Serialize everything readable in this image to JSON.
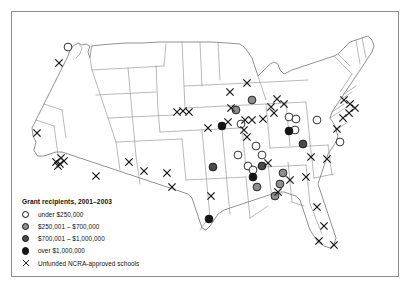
{
  "figure": {
    "region": "United States",
    "background_color": "#ffffff",
    "frame_color": "#8c8c8c",
    "state_outline_color": "#8a8a8a"
  },
  "legend": {
    "title": "Grant recipients, 2001–2003",
    "entries": [
      {
        "symbol": "open-circle",
        "label": "under $250,000",
        "fill": "#ffffff",
        "stroke": "#111111",
        "class": "dot-under"
      },
      {
        "symbol": "gray-circle",
        "label": "$250,001 – $700,000",
        "fill": "#8e8e8e",
        "stroke": "#111111",
        "class": "dot-mid"
      },
      {
        "symbol": "dark-gray-circle",
        "label": "$700,001 – $1,000,000",
        "fill": "#4a4a4a",
        "stroke": "#111111",
        "class": "dot-high"
      },
      {
        "symbol": "black-circle",
        "label": "over $1,000,000",
        "fill": "#151515",
        "stroke": "#111111",
        "class": "dot-top"
      },
      {
        "symbol": "x-mark",
        "label": "Unfunded NCRA-approved schools",
        "fill": "none",
        "stroke": "#1a1a1a",
        "class": "dot-x"
      }
    ]
  },
  "chart_data": {
    "type": "map",
    "title": "Grant recipients, 2001–2003",
    "projection": "united-states-albers",
    "grid": false,
    "legend_position": "bottom-left",
    "categories": [
      "under $250,000",
      "$250,001 – $700,000",
      "$700,001 – $1,000,000",
      "over $1,000,000",
      "Unfunded NCRA-approved schools"
    ],
    "series": [
      {
        "name": "under $250,000",
        "symbol": "open-circle",
        "fill": "#ffffff",
        "count": 12,
        "points": [
          {
            "x": 68,
            "y": 47
          },
          {
            "x": 241,
            "y": 124
          },
          {
            "x": 256,
            "y": 146
          },
          {
            "x": 262,
            "y": 155
          },
          {
            "x": 248,
            "y": 166
          },
          {
            "x": 238,
            "y": 155
          },
          {
            "x": 253,
            "y": 170
          },
          {
            "x": 289,
            "y": 117
          },
          {
            "x": 296,
            "y": 119
          },
          {
            "x": 295,
            "y": 130
          },
          {
            "x": 317,
            "y": 120
          },
          {
            "x": 340,
            "y": 142
          }
        ]
      },
      {
        "name": "$250,001 – $700,000",
        "symbol": "gray-circle",
        "fill": "#8e8e8e",
        "count": 6,
        "points": [
          {
            "x": 252,
            "y": 100
          },
          {
            "x": 257,
            "y": 187
          },
          {
            "x": 283,
            "y": 173
          },
          {
            "x": 280,
            "y": 184
          },
          {
            "x": 275,
            "y": 196
          },
          {
            "x": 236,
            "y": 110
          }
        ]
      },
      {
        "name": "$700,001 – $1,000,000",
        "symbol": "dark-gray-circle",
        "fill": "#4a4a4a",
        "count": 3,
        "points": [
          {
            "x": 303,
            "y": 144
          },
          {
            "x": 262,
            "y": 166
          },
          {
            "x": 213,
            "y": 167
          }
        ]
      },
      {
        "name": "over $1,000,000",
        "symbol": "black-circle",
        "fill": "#151515",
        "count": 4,
        "points": [
          {
            "x": 222,
            "y": 126
          },
          {
            "x": 253,
            "y": 177
          },
          {
            "x": 209,
            "y": 219
          },
          {
            "x": 289,
            "y": 131
          }
        ]
      },
      {
        "name": "Unfunded NCRA-approved schools",
        "symbol": "x-mark",
        "stroke": "#1a1a1a",
        "count": 46,
        "points": [
          {
            "x": 59,
            "y": 63
          },
          {
            "x": 37,
            "y": 133
          },
          {
            "x": 56,
            "y": 162
          },
          {
            "x": 60,
            "y": 164
          },
          {
            "x": 64,
            "y": 161
          },
          {
            "x": 61,
            "y": 158
          },
          {
            "x": 58,
            "y": 166
          },
          {
            "x": 96,
            "y": 176
          },
          {
            "x": 129,
            "y": 162
          },
          {
            "x": 144,
            "y": 171
          },
          {
            "x": 167,
            "y": 173
          },
          {
            "x": 172,
            "y": 187
          },
          {
            "x": 211,
            "y": 196
          },
          {
            "x": 177,
            "y": 112
          },
          {
            "x": 183,
            "y": 111
          },
          {
            "x": 189,
            "y": 112
          },
          {
            "x": 208,
            "y": 128
          },
          {
            "x": 228,
            "y": 122
          },
          {
            "x": 231,
            "y": 108
          },
          {
            "x": 245,
            "y": 120
          },
          {
            "x": 244,
            "y": 130
          },
          {
            "x": 247,
            "y": 137
          },
          {
            "x": 252,
            "y": 120
          },
          {
            "x": 230,
            "y": 92
          },
          {
            "x": 247,
            "y": 83
          },
          {
            "x": 271,
            "y": 107
          },
          {
            "x": 274,
            "y": 113
          },
          {
            "x": 277,
            "y": 99
          },
          {
            "x": 284,
            "y": 104
          },
          {
            "x": 263,
            "y": 119
          },
          {
            "x": 268,
            "y": 163
          },
          {
            "x": 278,
            "y": 192
          },
          {
            "x": 290,
            "y": 180
          },
          {
            "x": 306,
            "y": 177
          },
          {
            "x": 311,
            "y": 157
          },
          {
            "x": 327,
            "y": 159
          },
          {
            "x": 317,
            "y": 207
          },
          {
            "x": 324,
            "y": 226
          },
          {
            "x": 319,
            "y": 241
          },
          {
            "x": 334,
            "y": 245
          },
          {
            "x": 344,
            "y": 100
          },
          {
            "x": 350,
            "y": 104
          },
          {
            "x": 355,
            "y": 108
          },
          {
            "x": 349,
            "y": 113
          },
          {
            "x": 343,
            "y": 118
          },
          {
            "x": 337,
            "y": 129
          }
        ]
      }
    ]
  }
}
